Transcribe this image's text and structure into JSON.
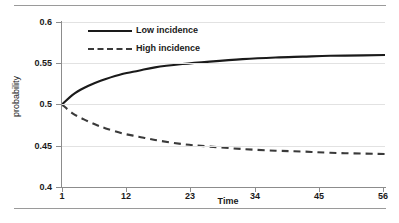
{
  "chart_data": {
    "type": "line",
    "title": "",
    "subtitle": "",
    "xlabel": "Time",
    "ylabel": "probability",
    "xlim": [
      1,
      60
    ],
    "ylim": [
      0.4,
      0.6
    ],
    "xticks": [
      "1",
      "12",
      "23",
      "34",
      "45",
      "56"
    ],
    "yticks": [
      "0.4",
      "0.45",
      "0.5",
      "0.55",
      "0.6"
    ],
    "grid": "horizontal",
    "legend_position": "top-left-inside",
    "x": [
      1,
      3,
      5,
      7,
      9,
      12,
      15,
      18,
      23,
      28,
      34,
      40,
      45,
      50,
      56,
      60
    ],
    "series": [
      {
        "name": "Low incidence",
        "style": "solid",
        "color": "#1a1a1a",
        "values": [
          0.5,
          0.512,
          0.52,
          0.526,
          0.531,
          0.537,
          0.541,
          0.545,
          0.549,
          0.552,
          0.555,
          0.557,
          0.558,
          0.559,
          0.5595,
          0.56
        ]
      },
      {
        "name": "High incidence",
        "style": "dashed",
        "color": "#3a3a3a",
        "values": [
          0.5,
          0.489,
          0.482,
          0.476,
          0.471,
          0.465,
          0.461,
          0.457,
          0.452,
          0.449,
          0.446,
          0.444,
          0.443,
          0.4415,
          0.4405,
          0.44
        ]
      }
    ]
  },
  "legend": {
    "items": [
      {
        "label": "Low incidence"
      },
      {
        "label": "High incidence"
      }
    ]
  },
  "axes": {
    "y_title": "probability",
    "x_title": "Time",
    "y_ticks": [
      "0.6",
      "0.55",
      "0.5",
      "0.45",
      "0.4"
    ],
    "x_ticks": [
      "1",
      "12",
      "23",
      "34",
      "45",
      "56"
    ]
  }
}
